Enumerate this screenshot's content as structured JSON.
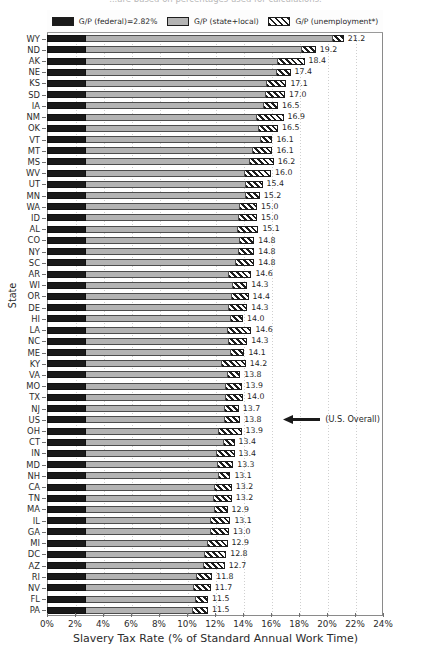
{
  "figure": {
    "title_clipped": "...are based on percentages used for calculations.",
    "ylabel": "State",
    "xlabel": "Slavery Tax Rate (% of Standard Annual Work Time)"
  },
  "legend": {
    "position": "upper-center",
    "items": [
      {
        "label": "G/P (federal)=2.82%",
        "swatch": "fed",
        "color": "#1a1a1a"
      },
      {
        "label": "G/P (state+local)",
        "swatch": "sl",
        "color": "#b3b3b3"
      },
      {
        "label": "G/P (unemployment*)",
        "swatch": "un",
        "color": "#ffffff"
      }
    ]
  },
  "annotation": {
    "text": "(U.S. Overall)",
    "target_state": "US",
    "icon": "left-arrow-icon"
  },
  "chart_data": {
    "type": "bar",
    "orientation": "horizontal",
    "stacked": true,
    "title": "",
    "xlabel": "Slavery Tax Rate (% of Standard Annual Work Time)",
    "ylabel": "State",
    "xlim": [
      0,
      24
    ],
    "xticks": [
      "0%",
      "2%",
      "4%",
      "6%",
      "8%",
      "10%",
      "12%",
      "14%",
      "16%",
      "18%",
      "20%",
      "22%",
      "24%"
    ],
    "xtick_values": [
      0,
      2,
      4,
      6,
      8,
      10,
      12,
      14,
      16,
      18,
      20,
      22,
      24
    ],
    "grid": "vertical-dotted",
    "federal_rate": 2.82,
    "series": [
      {
        "name": "G/P (federal)",
        "key": "federal"
      },
      {
        "name": "G/P (state+local)",
        "key": "state_local"
      },
      {
        "name": "G/P (unemployment*)",
        "key": "unemployment"
      }
    ],
    "categories": [
      "WY",
      "ND",
      "AK",
      "NE",
      "KS",
      "SD",
      "IA",
      "NM",
      "OK",
      "VT",
      "MT",
      "MS",
      "WV",
      "UT",
      "MN",
      "WA",
      "ID",
      "AL",
      "CO",
      "NY",
      "SC",
      "AR",
      "WI",
      "OR",
      "DE",
      "HI",
      "LA",
      "NC",
      "ME",
      "KY",
      "VA",
      "MO",
      "TX",
      "NJ",
      "US",
      "OH",
      "CT",
      "IN",
      "MD",
      "NH",
      "CA",
      "TN",
      "MA",
      "IL",
      "GA",
      "MI",
      "DC",
      "AZ",
      "RI",
      "NV",
      "FL",
      "PA"
    ],
    "values": [
      21.2,
      19.2,
      18.4,
      17.4,
      17.1,
      17.0,
      16.5,
      16.9,
      16.5,
      16.1,
      16.1,
      16.2,
      16.0,
      15.4,
      15.2,
      15.0,
      15.0,
      15.1,
      14.8,
      14.8,
      14.8,
      14.6,
      14.3,
      14.4,
      14.3,
      14.0,
      14.6,
      14.3,
      14.1,
      14.2,
      13.8,
      13.9,
      14.0,
      13.7,
      13.8,
      13.9,
      13.4,
      13.4,
      13.3,
      13.1,
      13.2,
      13.2,
      12.9,
      13.1,
      13.0,
      12.9,
      12.8,
      12.7,
      11.8,
      11.7,
      11.5,
      11.5
    ],
    "rows": [
      {
        "state": "WY",
        "total": 21.2,
        "federal": 2.82,
        "state_local": 17.6,
        "unemployment": 0.78
      },
      {
        "state": "ND",
        "total": 19.2,
        "federal": 2.82,
        "state_local": 15.4,
        "unemployment": 0.98
      },
      {
        "state": "AK",
        "total": 18.4,
        "federal": 2.82,
        "state_local": 13.7,
        "unemployment": 1.88
      },
      {
        "state": "NE",
        "total": 17.4,
        "federal": 2.82,
        "state_local": 13.6,
        "unemployment": 0.98
      },
      {
        "state": "KS",
        "total": 17.1,
        "federal": 2.82,
        "state_local": 12.9,
        "unemployment": 1.38
      },
      {
        "state": "SD",
        "total": 17.0,
        "federal": 2.82,
        "state_local": 12.8,
        "unemployment": 1.38
      },
      {
        "state": "IA",
        "total": 16.5,
        "federal": 2.82,
        "state_local": 12.7,
        "unemployment": 0.98
      },
      {
        "state": "NM",
        "total": 16.9,
        "federal": 2.82,
        "state_local": 12.2,
        "unemployment": 1.88
      },
      {
        "state": "OK",
        "total": 16.5,
        "federal": 2.82,
        "state_local": 12.3,
        "unemployment": 1.38
      },
      {
        "state": "VT",
        "total": 16.1,
        "federal": 2.82,
        "state_local": 12.5,
        "unemployment": 0.78
      },
      {
        "state": "MT",
        "total": 16.1,
        "federal": 2.82,
        "state_local": 11.9,
        "unemployment": 1.38
      },
      {
        "state": "MS",
        "total": 16.2,
        "federal": 2.82,
        "state_local": 11.7,
        "unemployment": 1.68
      },
      {
        "state": "WV",
        "total": 16.0,
        "federal": 2.82,
        "state_local": 11.3,
        "unemployment": 1.88
      },
      {
        "state": "UT",
        "total": 15.4,
        "federal": 2.82,
        "state_local": 11.4,
        "unemployment": 1.18
      },
      {
        "state": "MN",
        "total": 15.2,
        "federal": 2.82,
        "state_local": 11.4,
        "unemployment": 0.98
      },
      {
        "state": "WA",
        "total": 15.0,
        "federal": 2.82,
        "state_local": 11.0,
        "unemployment": 1.18
      },
      {
        "state": "ID",
        "total": 15.0,
        "federal": 2.82,
        "state_local": 10.9,
        "unemployment": 1.28
      },
      {
        "state": "AL",
        "total": 15.1,
        "federal": 2.82,
        "state_local": 10.8,
        "unemployment": 1.48
      },
      {
        "state": "CO",
        "total": 14.8,
        "federal": 2.82,
        "state_local": 11.0,
        "unemployment": 0.98
      },
      {
        "state": "NY",
        "total": 14.8,
        "federal": 2.82,
        "state_local": 10.9,
        "unemployment": 1.08
      },
      {
        "state": "SC",
        "total": 14.8,
        "federal": 2.82,
        "state_local": 10.7,
        "unemployment": 1.28
      },
      {
        "state": "AR",
        "total": 14.6,
        "federal": 2.82,
        "state_local": 10.2,
        "unemployment": 1.58
      },
      {
        "state": "WI",
        "total": 14.3,
        "federal": 2.82,
        "state_local": 10.5,
        "unemployment": 0.98
      },
      {
        "state": "OR",
        "total": 14.4,
        "federal": 2.82,
        "state_local": 10.4,
        "unemployment": 1.18
      },
      {
        "state": "DE",
        "total": 14.3,
        "federal": 2.82,
        "state_local": 10.2,
        "unemployment": 1.28
      },
      {
        "state": "HI",
        "total": 14.0,
        "federal": 2.82,
        "state_local": 10.3,
        "unemployment": 0.88
      },
      {
        "state": "LA",
        "total": 14.6,
        "federal": 2.82,
        "state_local": 10.1,
        "unemployment": 1.68
      },
      {
        "state": "NC",
        "total": 14.3,
        "federal": 2.82,
        "state_local": 10.2,
        "unemployment": 1.28
      },
      {
        "state": "ME",
        "total": 14.1,
        "federal": 2.82,
        "state_local": 10.3,
        "unemployment": 0.98
      },
      {
        "state": "KY",
        "total": 14.2,
        "federal": 2.82,
        "state_local": 9.7,
        "unemployment": 1.68
      },
      {
        "state": "VA",
        "total": 13.8,
        "federal": 2.82,
        "state_local": 10.1,
        "unemployment": 0.88
      },
      {
        "state": "MO",
        "total": 13.9,
        "federal": 2.82,
        "state_local": 10.0,
        "unemployment": 1.08
      },
      {
        "state": "TX",
        "total": 14.0,
        "federal": 2.82,
        "state_local": 10.0,
        "unemployment": 1.18
      },
      {
        "state": "NJ",
        "total": 13.7,
        "federal": 2.82,
        "state_local": 9.9,
        "unemployment": 0.98
      },
      {
        "state": "US",
        "total": 13.8,
        "federal": 2.82,
        "state_local": 9.9,
        "unemployment": 1.08
      },
      {
        "state": "OH",
        "total": 13.9,
        "federal": 2.82,
        "state_local": 9.5,
        "unemployment": 1.58
      },
      {
        "state": "CT",
        "total": 13.4,
        "federal": 2.82,
        "state_local": 9.8,
        "unemployment": 0.78
      },
      {
        "state": "IN",
        "total": 13.4,
        "federal": 2.82,
        "state_local": 9.3,
        "unemployment": 1.28
      },
      {
        "state": "MD",
        "total": 13.3,
        "federal": 2.82,
        "state_local": 9.4,
        "unemployment": 1.08
      },
      {
        "state": "NH",
        "total": 13.1,
        "federal": 2.82,
        "state_local": 9.5,
        "unemployment": 0.78
      },
      {
        "state": "CA",
        "total": 13.2,
        "federal": 2.82,
        "state_local": 9.2,
        "unemployment": 1.18
      },
      {
        "state": "TN",
        "total": 13.2,
        "federal": 2.82,
        "state_local": 9.1,
        "unemployment": 1.28
      },
      {
        "state": "MA",
        "total": 12.9,
        "federal": 2.82,
        "state_local": 9.2,
        "unemployment": 0.88
      },
      {
        "state": "IL",
        "total": 13.1,
        "federal": 2.82,
        "state_local": 8.9,
        "unemployment": 1.38
      },
      {
        "state": "GA",
        "total": 13.0,
        "federal": 2.82,
        "state_local": 8.9,
        "unemployment": 1.28
      },
      {
        "state": "MI",
        "total": 12.9,
        "federal": 2.82,
        "state_local": 8.7,
        "unemployment": 1.38
      },
      {
        "state": "DC",
        "total": 12.8,
        "federal": 2.82,
        "state_local": 8.5,
        "unemployment": 1.48
      },
      {
        "state": "AZ",
        "total": 12.7,
        "federal": 2.82,
        "state_local": 8.4,
        "unemployment": 1.48
      },
      {
        "state": "RI",
        "total": 11.8,
        "federal": 2.82,
        "state_local": 7.9,
        "unemployment": 1.08
      },
      {
        "state": "NV",
        "total": 11.7,
        "federal": 2.82,
        "state_local": 7.7,
        "unemployment": 1.18
      },
      {
        "state": "FL",
        "total": 11.5,
        "federal": 2.82,
        "state_local": 7.8,
        "unemployment": 0.88
      },
      {
        "state": "PA",
        "total": 11.5,
        "federal": 2.82,
        "state_local": 7.6,
        "unemployment": 1.08
      }
    ]
  }
}
